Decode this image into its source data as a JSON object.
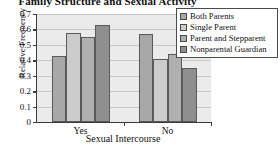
{
  "chart_data": {
    "type": "bar",
    "title": "Family Structure and Sexual Activity",
    "xlabel": "Sexual Intercourse",
    "ylabel": "Relative Frequency",
    "categories": [
      "Yes",
      "No"
    ],
    "ylim": [
      0,
      0.7
    ],
    "yticks": [
      "0",
      "0.1",
      "0.2",
      "0.3",
      "0.4",
      "0.5",
      "0.6",
      "0.7"
    ],
    "ytick_values": [
      0,
      0.1,
      0.2,
      0.3,
      0.4,
      0.5,
      0.6,
      0.7
    ],
    "grid": true,
    "legend_position": "right",
    "series": [
      {
        "name": "Both Parents",
        "color": "#a8a8a8",
        "values": [
          0.43,
          0.57
        ]
      },
      {
        "name": "Single Parent",
        "color": "#cccccc",
        "values": [
          0.58,
          0.41
        ]
      },
      {
        "name": "Parent and Stepparent",
        "color": "#b0b0b0",
        "values": [
          0.55,
          0.44
        ]
      },
      {
        "name": "Nonparental Guardian",
        "color": "#8f8f8f",
        "values": [
          0.63,
          0.35
        ]
      }
    ]
  },
  "legend": {
    "items": [
      {
        "label": "Both Parents"
      },
      {
        "label": "Single Parent"
      },
      {
        "label": "Parent and Stepparent"
      },
      {
        "label": "Nonparental Guardian"
      }
    ]
  }
}
